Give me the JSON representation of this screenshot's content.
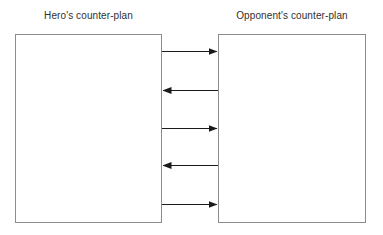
{
  "canvas": {
    "width": 383,
    "height": 235,
    "background": "#ffffff"
  },
  "diagram": {
    "type": "exchange-flow-diagram",
    "line_color": "#1a1a1a",
    "box_border_color": "#8c8c8c",
    "box_fill": "#ffffff",
    "text_color": "#2f2f2f",
    "left": {
      "label": "Hero's counter-plan",
      "box": {
        "x": 15,
        "y": 34,
        "width": 147,
        "height": 189
      }
    },
    "right": {
      "label": "Opponent's counter-plan",
      "box": {
        "x": 218,
        "y": 34,
        "width": 148,
        "height": 189
      }
    },
    "arrows": [
      {
        "index": 1,
        "direction": "right",
        "y": 51,
        "from": "left",
        "to": "right"
      },
      {
        "index": 2,
        "direction": "left",
        "y": 90,
        "from": "right",
        "to": "left"
      },
      {
        "index": 3,
        "direction": "right",
        "y": 128,
        "from": "left",
        "to": "right"
      },
      {
        "index": 4,
        "direction": "left",
        "y": 165,
        "from": "right",
        "to": "left"
      },
      {
        "index": 5,
        "direction": "right",
        "y": 204,
        "from": "left",
        "to": "right"
      }
    ],
    "arrow_span": {
      "x_start": 162,
      "x_end": 218
    }
  }
}
